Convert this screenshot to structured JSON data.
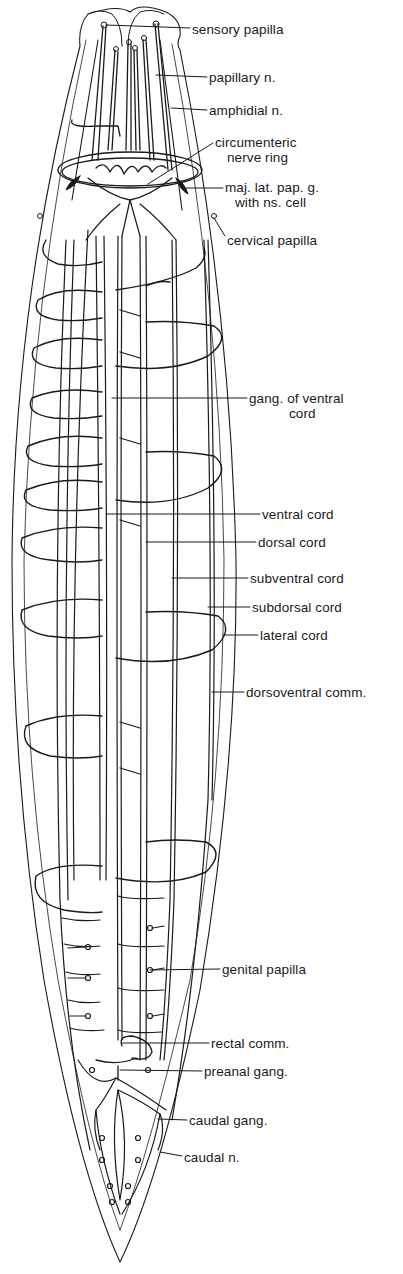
{
  "figure": {
    "colors": {
      "ink": "#1a1a1a",
      "background": "#ffffff"
    },
    "labels": [
      {
        "id": "sensory-papilla",
        "text": "sensory papilla",
        "x": 192,
        "y": 24,
        "leader_from": [
          160,
          26
        ]
      },
      {
        "id": "papillary-n",
        "text": "papillary n.",
        "x": 209,
        "y": 70,
        "leader_from": [
          155,
          75
        ]
      },
      {
        "id": "amphidial-n",
        "text": "amphidial n.",
        "x": 209,
        "y": 103,
        "leader_from": [
          172,
          108
        ]
      },
      {
        "id": "circumenteric-nerve-ring",
        "text": "circumenteric",
        "text2": "nerve ring",
        "x": 215,
        "y": 135,
        "leader_from": [
          150,
          183
        ]
      },
      {
        "id": "maj-lat-pap-g",
        "text": "maj. lat. pap. g.",
        "text2": "with ns. cell",
        "x": 225,
        "y": 180,
        "leader_from": [
          185,
          188
        ]
      },
      {
        "id": "cervical-papilla",
        "text": "cervical papilla",
        "x": 227,
        "y": 233,
        "leader_from": [
          215,
          218
        ]
      },
      {
        "id": "gang-of-ventral-cord",
        "text": "gang. of ventral",
        "text2": "cord",
        "x": 249,
        "y": 392,
        "leader_from": [
          112,
          399
        ]
      },
      {
        "id": "ventral-cord",
        "text": "ventral cord",
        "x": 262,
        "y": 507,
        "leader_from": [
          107,
          515
        ]
      },
      {
        "id": "dorsal-cord",
        "text": "dorsal cord",
        "x": 258,
        "y": 535,
        "leader_from": [
          146,
          542
        ]
      },
      {
        "id": "subventral-cord",
        "text": "subventral cord",
        "x": 250,
        "y": 572,
        "leader_from": [
          172,
          578
        ]
      },
      {
        "id": "subdorsal-cord",
        "text": "subdorsal cord",
        "x": 252,
        "y": 601,
        "leader_from": [
          208,
          607
        ]
      },
      {
        "id": "lateral-cord",
        "text": "lateral cord",
        "x": 260,
        "y": 628,
        "leader_from": [
          223,
          635
        ]
      },
      {
        "id": "dorsoventral-comm",
        "text": "dorsoventral comm.",
        "x": 246,
        "y": 692,
        "leader_from": [
          217,
          693
        ]
      },
      {
        "id": "genital-papilla",
        "text": "genital papilla",
        "x": 222,
        "y": 961,
        "leader_from": [
          150,
          970
        ]
      },
      {
        "id": "rectal-comm",
        "text": "rectal comm.",
        "x": 211,
        "y": 1037,
        "leader_from": [
          140,
          1043
        ]
      },
      {
        "id": "preanal-gang",
        "text": "preanal gang.",
        "x": 204,
        "y": 1065,
        "leader_from": [
          120,
          1070
        ]
      },
      {
        "id": "caudal-gang",
        "text": "caudal gang.",
        "x": 189,
        "y": 1114,
        "leader_from": [
          158,
          1119
        ]
      },
      {
        "id": "caudal-n",
        "text": "caudal n.",
        "x": 184,
        "y": 1151,
        "leader_from": [
          160,
          1152
        ]
      }
    ]
  }
}
